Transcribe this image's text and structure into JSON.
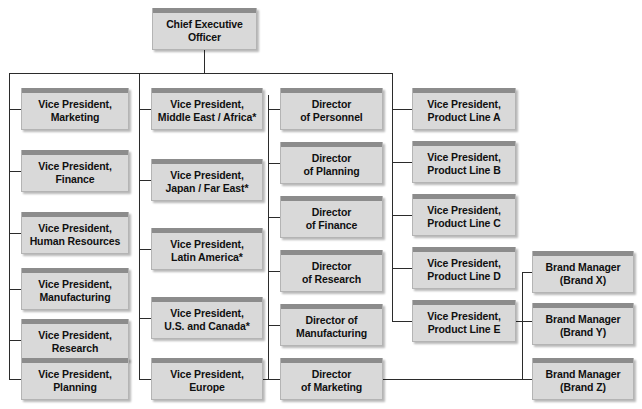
{
  "diagram": {
    "type": "organizational-chart",
    "title": "",
    "colors": {
      "box_body": "#d9d9d9",
      "box_cap": "#8c8c8c",
      "box_border": "#b4b4b4",
      "line": "#2b2b2b",
      "text": "#101010",
      "background": "#ffffff"
    },
    "root": {
      "label": "Chief Executive\nOfficer"
    },
    "columns": [
      {
        "name": "functional-vps",
        "nodes": [
          {
            "label": "Vice President,\nMarketing"
          },
          {
            "label": "Vice President,\nFinance"
          },
          {
            "label": "Vice President,\nHuman Resources"
          },
          {
            "label": "Vice President,\nManufacturing"
          },
          {
            "label": "Vice President,\nResearch"
          },
          {
            "label": "Vice President,\nPlanning"
          }
        ]
      },
      {
        "name": "regional-vps",
        "nodes": [
          {
            "label": "Vice President,\nMiddle East / Africa*"
          },
          {
            "label": "Vice President,\nJapan / Far East*"
          },
          {
            "label": "Vice President,\nLatin America*"
          },
          {
            "label": "Vice President,\nU.S. and Canada*"
          },
          {
            "label": "Vice President,\nEurope"
          }
        ]
      },
      {
        "name": "directors",
        "nodes": [
          {
            "label": "Director\nof Personnel"
          },
          {
            "label": "Director\nof Planning"
          },
          {
            "label": "Director\nof Finance"
          },
          {
            "label": "Director\nof Research"
          },
          {
            "label": "Director of\nManufacturing"
          },
          {
            "label": "Director\nof Marketing"
          }
        ]
      },
      {
        "name": "product-line-vps",
        "nodes": [
          {
            "label": "Vice President,\nProduct Line A"
          },
          {
            "label": "Vice President,\nProduct Line B"
          },
          {
            "label": "Vice President,\nProduct Line C"
          },
          {
            "label": "Vice President,\nProduct Line D"
          },
          {
            "label": "Vice President,\nProduct Line E"
          }
        ]
      },
      {
        "name": "brand-managers",
        "nodes": [
          {
            "label": "Brand Manager\n(Brand X)"
          },
          {
            "label": "Brand Manager\n(Brand Y)"
          },
          {
            "label": "Brand Manager\n(Brand Z)"
          }
        ]
      }
    ]
  }
}
